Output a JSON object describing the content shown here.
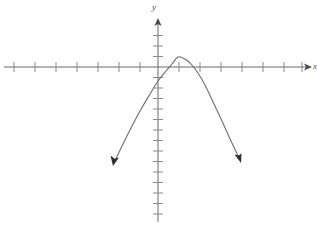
{
  "figure": {
    "title": "",
    "background_color": "#fefefe",
    "width": 317,
    "height": 231
  },
  "axes": {
    "x_axis": {
      "label": "x",
      "color": "#6b6b6b",
      "origin_px": 158,
      "y_px": 67,
      "start_px": 4,
      "end_px": 312,
      "tick_spacing_px": 21,
      "tick_half_length_px": 5,
      "arrow": "right"
    },
    "y_axis": {
      "label": "y",
      "color": "#6b6b6b",
      "origin_px": 67,
      "x_px": 158,
      "start_px": 18,
      "end_px": 222,
      "tick_spacing_px": 10.5,
      "tick_half_length_px": 5,
      "arrow": "up"
    }
  },
  "chart_data": {
    "type": "line",
    "title": "",
    "xlabel": "x",
    "ylabel": "y",
    "grid": false,
    "legend": null,
    "curve_color": "#6e6e6e",
    "curve_label": "downward parabola",
    "vertex": [
      1,
      0.5
    ],
    "x_intercepts": [
      -0.05,
      2.0
    ],
    "xlim": [
      -7.3,
      7.3
    ],
    "ylim": [
      -14.0,
      4.5
    ],
    "x_tick_values": [
      -7,
      -6,
      -5,
      -4,
      -3,
      -2,
      -1,
      1,
      2,
      3,
      4,
      5,
      6,
      7
    ],
    "y_tick_values": [
      -14,
      -13,
      -12,
      -11,
      -10,
      -9,
      -8,
      -7,
      -6,
      -5,
      -4,
      -3,
      -2,
      -1,
      1,
      2,
      3,
      4
    ],
    "arrowheads": [
      "left-end-down",
      "right-end-down"
    ],
    "x": [
      -2.1,
      -1.8,
      -1.5,
      -1.2,
      -0.9,
      -0.6,
      -0.3,
      0.0,
      0.3,
      0.6,
      0.9,
      1.0,
      1.1,
      1.4,
      1.7,
      2.0,
      2.3,
      2.6,
      2.9,
      3.2,
      3.5,
      3.8,
      4.0
    ],
    "y": [
      -9.1,
      -7.3,
      -5.7,
      -4.3,
      -3.1,
      -2.1,
      -1.3,
      -0.6,
      -0.1,
      0.3,
      0.5,
      0.5,
      0.5,
      0.3,
      0.0,
      -0.6,
      -1.3,
      -2.2,
      -3.3,
      -4.6,
      -6.1,
      -7.8,
      -9.0
    ],
    "series": [
      {
        "name": "parabola",
        "points_px": [
          [
            114,
            163
          ],
          [
            122,
            146
          ],
          [
            131,
            128
          ],
          [
            140,
            111
          ],
          [
            150,
            94
          ],
          [
            158,
            81
          ],
          [
            166,
            71
          ],
          [
            172,
            64
          ],
          [
            178,
            57
          ],
          [
            185,
            59
          ],
          [
            191,
            64
          ],
          [
            198,
            73
          ],
          [
            206,
            87
          ],
          [
            214,
            104
          ],
          [
            222,
            121
          ],
          [
            231,
            141
          ],
          [
            240,
            160
          ]
        ]
      }
    ]
  },
  "annotations": {
    "left_arrow_tip_px": [
      114,
      165
    ],
    "right_arrow_tip_px": [
      240,
      162
    ]
  }
}
